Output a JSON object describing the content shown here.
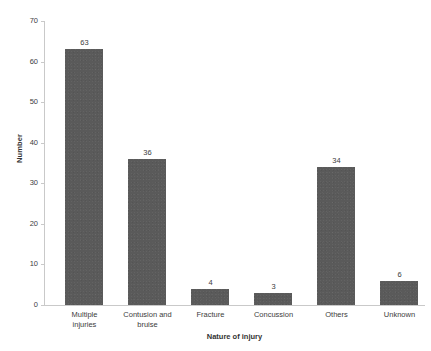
{
  "chart_data": {
    "type": "bar",
    "title": "",
    "xlabel": "Nature of injury",
    "ylabel": "Number",
    "categories": [
      "Multiple injuries",
      "Contusion and bruise",
      "Fracture",
      "Concussion",
      "Others",
      "Unknown"
    ],
    "category_lines": [
      [
        "Multiple",
        "injuries"
      ],
      [
        "Contusion and",
        "bruise"
      ],
      [
        "Fracture"
      ],
      [
        "Concussion"
      ],
      [
        "Others"
      ],
      [
        "Unknown"
      ]
    ],
    "values": [
      63,
      36,
      4,
      3,
      34,
      6
    ],
    "ylim": [
      0,
      70
    ],
    "yticks": [
      0,
      10,
      20,
      30,
      40,
      50,
      60,
      70
    ],
    "ytick_labels": [
      "0",
      "10",
      "20",
      "30",
      "40",
      "50",
      "60",
      "70"
    ],
    "grid": false,
    "legend": null,
    "bar_color": "#5a5a5a",
    "axis_color": "#c9c9c9",
    "text_color": "#3c3c3c",
    "background": "#ffffff",
    "data_labels": [
      "63",
      "36",
      "4",
      "3",
      "34",
      "6"
    ]
  }
}
